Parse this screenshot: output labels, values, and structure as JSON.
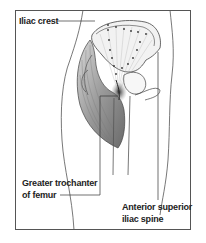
{
  "figure": {
    "labels": {
      "iliac_crest": "Iliac crest",
      "greater_trochanter_line1": "Greater trochanter",
      "greater_trochanter_line2": "of femur",
      "asis_line1": "Anterior superior",
      "asis_line2": "iliac spine"
    },
    "colors": {
      "line": "#444444",
      "muscle_shade": "#8a8a8a",
      "frame": "#555555",
      "text": "#222222"
    }
  }
}
